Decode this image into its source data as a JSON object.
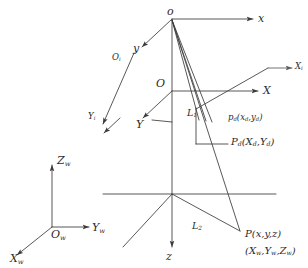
{
  "figure": {
    "kind": "camera-projection-geometry-diagram",
    "stroke_color": "#3a3a3a",
    "text_color": "#2b2b2b",
    "background": "#ffffff"
  },
  "image_plane_frame": {
    "origin_label": "o",
    "x_axis_label": "x",
    "y_axis_label": "y"
  },
  "pixel_frame": {
    "origin_label": "O",
    "x_axis_label": "X",
    "y_axis_label": "Y"
  },
  "sensor_frame": {
    "origin_label": "O",
    "origin_sub": "i",
    "x_axis_label": "X",
    "x_axis_sub": "i",
    "y_axis_label": "Y",
    "y_axis_sub": "i"
  },
  "camera_frame": {
    "z_axis_label": "z"
  },
  "world_frame": {
    "origin_label": "O",
    "origin_sub": "w",
    "x_axis_label": "X",
    "x_axis_sub": "w",
    "y_axis_label": "Y",
    "y_axis_sub": "w",
    "z_axis_label": "Z",
    "z_axis_sub": "w"
  },
  "points": {
    "distorted_image_point": {
      "name": "p",
      "sub": "d",
      "coords": "(x",
      "coords_sub1": "d",
      "coords_mid": ",y",
      "coords_sub2": "d",
      "coords_end": ")"
    },
    "distorted_pixel_point": {
      "name": "P",
      "sub": "d",
      "coords_open": "(X",
      "coords_sub1": "d",
      "coords_mid": ",Y",
      "coords_sub2": "d",
      "coords_end": ")"
    },
    "object_point": {
      "camera_label": "P(x,y,z)",
      "world_label_open": "(X",
      "world_sub1": "w",
      "world_mid1": ",Y",
      "world_sub2": "w",
      "world_mid2": ",Z",
      "world_sub3": "w",
      "world_end": ")"
    }
  },
  "rays": {
    "near_segment_label": "L",
    "near_segment_sub": "1",
    "far_segment_label": "L",
    "far_segment_sub": "2"
  }
}
